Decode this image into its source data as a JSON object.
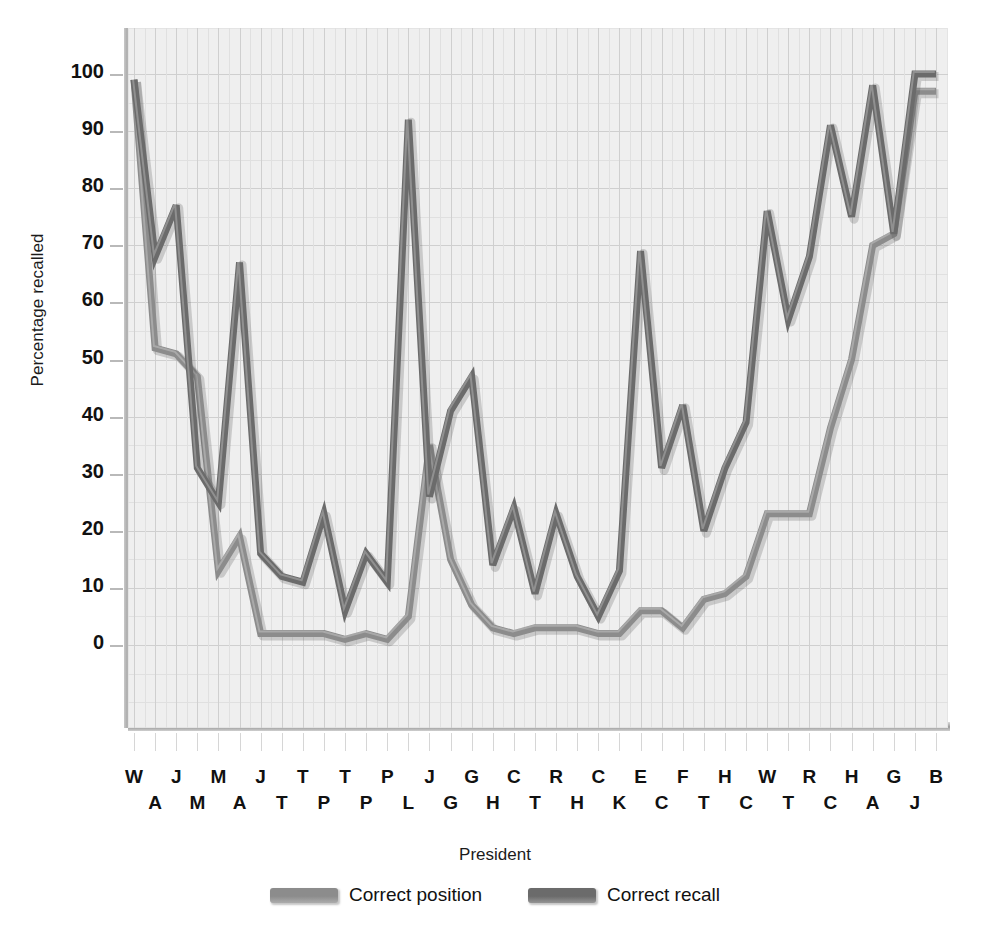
{
  "axes": {
    "ylabel": "Percentage recalled",
    "xlabel": "President",
    "yticks": [
      "100",
      "90",
      "80",
      "70",
      "60",
      "50",
      "40",
      "30",
      "20",
      "10",
      "0"
    ]
  },
  "legend": {
    "items": [
      {
        "label": "Correct position",
        "color": "#8c8c8c"
      },
      {
        "label": "Correct recall",
        "color": "#6b6b6b"
      }
    ]
  },
  "colors": {
    "correct_position": "#8c8c8c",
    "correct_recall": "#6b6b6b",
    "plot_background": "#efefef",
    "grid": "#cfcfcf",
    "text": "#111111"
  },
  "chart_data": {
    "type": "line",
    "title": "",
    "xlabel": "President",
    "ylabel": "Percentage recalled",
    "ylim": [
      0,
      105
    ],
    "yticks": [
      0,
      10,
      20,
      30,
      40,
      50,
      60,
      70,
      80,
      90,
      100
    ],
    "grid": true,
    "legend_position": "bottom-center",
    "categories": [
      "W\nA",
      "J\nA",
      "J\nM",
      "M\nM",
      "M\nA",
      "J\nA",
      "J\nvB",
      "H\nT",
      "T\nT",
      "P\nP",
      "T\nF",
      "F\nP",
      "P\nB",
      "B\nL",
      "J\nG",
      "H\nG",
      "G\nC",
      "A\nH",
      "C\nMcK",
      "H\nT",
      "R\nH",
      "W\nH",
      "C\nT",
      "R\nK",
      "E\nN",
      "J\nC",
      "F\nB",
      "R\nT",
      "H\nH",
      "C\nC",
      "W\nW",
      "T\nT",
      "R\nR",
      "McK\nC",
      "H\nH",
      "G\nA",
      "G\nG",
      "L\nJ",
      "B\nP"
    ],
    "x_labels_row0": [
      "W",
      "",
      "J",
      "",
      "M",
      "",
      "J",
      "",
      "H",
      "",
      "P",
      "",
      "F",
      "",
      "B",
      "",
      "J",
      "",
      "H",
      "",
      "A",
      "",
      "H",
      "",
      "R",
      "",
      "W",
      "",
      "C",
      "",
      "R",
      "",
      "E",
      "",
      "J",
      "",
      "F",
      "",
      "R"
    ],
    "x_labels_row1": [
      "",
      "A",
      "",
      "M",
      "",
      "A",
      "",
      "vB",
      "",
      "T",
      "",
      "T",
      "",
      "P",
      "",
      "L",
      "",
      "G",
      "",
      "G",
      "",
      "C",
      "",
      "McK",
      "",
      "T",
      "",
      "H",
      "",
      "H",
      "",
      "T",
      "",
      "K",
      "",
      "N",
      "",
      "C",
      "",
      "B"
    ],
    "x_labels_flat": [
      "W A",
      "J A",
      "J M",
      "M M",
      "M A",
      "J A",
      "J vB",
      "H T",
      "T T",
      "P P",
      "T F",
      "F P",
      "P B",
      "B L",
      "J G",
      "H G",
      "G C",
      "A H",
      "C McK",
      "H T",
      "R H",
      "W H",
      "C T",
      "R K",
      "E N",
      "J C",
      "F B",
      "R T",
      "H H",
      "C C",
      "W W",
      "T T",
      "R R",
      "McK C",
      "H H",
      "G A",
      "G G",
      "L J",
      "B P"
    ],
    "presidents": [
      "Washington",
      "J. Adams",
      "Jefferson",
      "Madison",
      "Monroe",
      "J.Q. Adams",
      "Jackson",
      "Van Buren",
      "W. Harrison",
      "Tyler",
      "Polk",
      "Taylor",
      "Fillmore",
      "Pierce",
      "Buchanan",
      "Lincoln",
      "A. Johnson",
      "Grant",
      "Hayes",
      "Garfield",
      "Arthur",
      "Cleveland",
      "B. Harrison",
      "McKinley",
      "T. Roosevelt",
      "Taft",
      "Wilson",
      "Harding",
      "Coolidge",
      "Hoover",
      "F. Roosevelt",
      "Truman",
      "Eisenhower",
      "Kennedy",
      "L. Johnson",
      "Nixon",
      "Ford",
      "Carter",
      "Reagan"
    ],
    "series": [
      {
        "name": "Correct recall",
        "color": "#6b6b6b",
        "values": [
          99,
          68,
          77,
          31,
          25,
          67,
          16,
          12,
          11,
          23,
          6,
          16,
          11,
          92,
          26,
          41,
          47,
          14,
          24,
          9,
          23,
          12,
          5,
          13,
          69,
          31,
          42,
          20,
          31,
          39,
          76,
          57,
          68,
          91,
          75,
          98,
          72,
          100,
          100
        ]
      },
      {
        "name": "Correct position",
        "color": "#8c8c8c",
        "values": [
          99,
          52,
          51,
          47,
          13,
          19,
          2,
          2,
          2,
          2,
          1,
          2,
          1,
          5,
          35,
          15,
          7,
          3,
          2,
          3,
          3,
          3,
          2,
          2,
          6,
          6,
          3,
          8,
          9,
          12,
          23,
          23,
          23,
          38,
          50,
          70,
          72,
          97,
          97
        ]
      }
    ],
    "annotations": []
  }
}
